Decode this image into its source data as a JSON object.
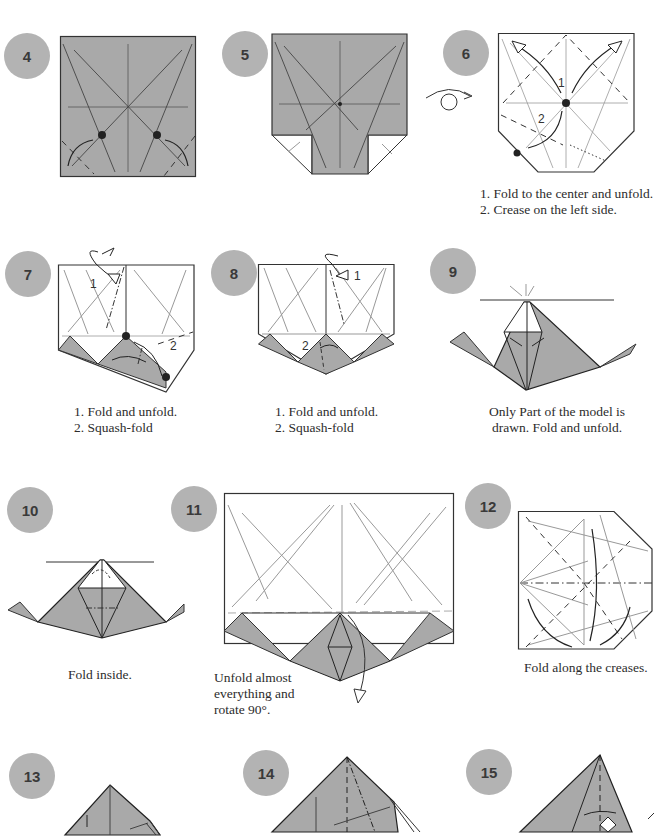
{
  "page": {
    "colors": {
      "paper_gray": "#a9a9a9",
      "badge_gray": "#b3b3b3",
      "line": "#333333",
      "crease": "#8a8a8a",
      "background": "#ffffff"
    },
    "steps": [
      {
        "number": "4",
        "caption_lines": []
      },
      {
        "number": "5",
        "caption_lines": []
      },
      {
        "number": "6",
        "caption_lines": [
          "1. Fold to the center and unfold.",
          "2. Crease on the left side."
        ],
        "diagram_labels": [
          "1",
          "2"
        ]
      },
      {
        "number": "7",
        "caption_lines": [
          "1. Fold and unfold.",
          "2. Squash-fold"
        ],
        "diagram_labels": [
          "1",
          "2"
        ]
      },
      {
        "number": "8",
        "caption_lines": [
          "1. Fold and unfold.",
          "2. Squash-fold"
        ],
        "diagram_labels": [
          "1",
          "2"
        ]
      },
      {
        "number": "9",
        "caption_lines": [
          "Only Part of the model is",
          "drawn. Fold and unfold."
        ]
      },
      {
        "number": "10",
        "caption_lines": [
          "Fold inside."
        ]
      },
      {
        "number": "11",
        "caption_lines": [
          "Unfold almost",
          "everything and",
          "rotate 90°."
        ]
      },
      {
        "number": "12",
        "caption_lines": [
          "Fold along the creases."
        ]
      },
      {
        "number": "13",
        "caption_lines": []
      },
      {
        "number": "14",
        "caption_lines": []
      },
      {
        "number": "15",
        "caption_lines": []
      }
    ]
  }
}
